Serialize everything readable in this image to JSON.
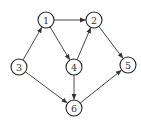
{
  "diagram": {
    "type": "directed-graph",
    "node_radius": 8,
    "colors": {
      "stroke": "#222222",
      "fill": "#ffffff",
      "text": "#333333",
      "edge": "#333333"
    },
    "nodes": [
      {
        "id": "1",
        "label": "1",
        "x": 46,
        "y": 20
      },
      {
        "id": "2",
        "label": "2",
        "x": 94,
        "y": 20
      },
      {
        "id": "3",
        "label": "3",
        "x": 19,
        "y": 67
      },
      {
        "id": "4",
        "label": "4",
        "x": 74,
        "y": 67
      },
      {
        "id": "5",
        "label": "5",
        "x": 128,
        "y": 65
      },
      {
        "id": "6",
        "label": "6",
        "x": 74,
        "y": 108
      }
    ],
    "edges": [
      {
        "from": "3",
        "to": "1"
      },
      {
        "from": "1",
        "to": "2"
      },
      {
        "from": "1",
        "to": "4"
      },
      {
        "from": "4",
        "to": "2"
      },
      {
        "from": "2",
        "to": "5"
      },
      {
        "from": "3",
        "to": "6"
      },
      {
        "from": "4",
        "to": "6"
      },
      {
        "from": "6",
        "to": "5"
      }
    ]
  }
}
